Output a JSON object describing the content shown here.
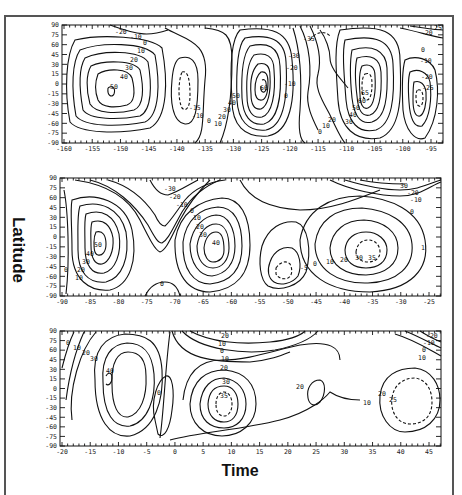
{
  "figure": {
    "ylabel": "Latitude",
    "xlabel": "Time"
  },
  "chart_data": [
    {
      "type": "contour",
      "title": "",
      "xlabel": "Time",
      "ylabel": "Latitude",
      "xlim": [
        -160,
        -93
      ],
      "ylim": [
        -90,
        90
      ],
      "x_ticks": [
        "-160",
        "-155",
        "-150",
        "-145",
        "-140",
        "-135",
        "-130",
        "-125",
        "-120",
        "-115",
        "-110",
        "-105",
        "-100",
        "-95"
      ],
      "y_ticks": [
        "90",
        "75",
        "60",
        "45",
        "30",
        "15",
        "0",
        "-15",
        "-30",
        "-45",
        "-60",
        "-75",
        "-90"
      ],
      "contour_levels": [
        "-35",
        "-30",
        "-25",
        "-20",
        "-15",
        "-10",
        "0",
        "10",
        "20",
        "30",
        "40",
        "50",
        "60",
        "65"
      ],
      "extrema": [
        {
          "x": -151,
          "y": -10,
          "value": 50,
          "type": "max"
        },
        {
          "x": -137,
          "y": -20,
          "value": -15,
          "type": "min"
        },
        {
          "x": -127,
          "y": 0,
          "value": 60,
          "type": "max"
        },
        {
          "x": -118,
          "y": 75,
          "value": -35,
          "type": "min"
        },
        {
          "x": -106,
          "y": -10,
          "value": 65,
          "type": "max"
        },
        {
          "x": -96,
          "y": -10,
          "value": -25,
          "type": "min"
        }
      ],
      "labels": [
        "-20",
        "-10",
        "0",
        "10",
        "20",
        "30",
        "40",
        "50",
        "-15",
        "-10",
        "0",
        "10",
        "20",
        "30",
        "40",
        "50",
        "60",
        "-35",
        "-30",
        "-20",
        "-10",
        "0",
        "0",
        "10",
        "20",
        "30",
        "40",
        "50",
        "60",
        "65",
        "-25",
        "-20",
        "-10",
        "0",
        "-20"
      ]
    },
    {
      "type": "contour",
      "xlabel": "Time",
      "ylabel": "Latitude",
      "xlim": [
        -90,
        -22
      ],
      "ylim": [
        -90,
        90
      ],
      "x_ticks": [
        "-90",
        "-85",
        "-80",
        "-75",
        "-70",
        "-65",
        "-60",
        "-55",
        "-50",
        "-45",
        "-40",
        "-35",
        "-30",
        "-25"
      ],
      "y_ticks": [
        "90",
        "75",
        "60",
        "45",
        "30",
        "15",
        "0",
        "-15",
        "-30",
        "-45",
        "-60",
        "-75",
        "-90"
      ],
      "contour_levels": [
        "-30",
        "-20",
        "-10",
        "-5",
        "0",
        "10",
        "20",
        "30",
        "35",
        "40",
        "50"
      ],
      "extrema": [
        {
          "x": -82,
          "y": 0,
          "value": 50,
          "type": "max"
        },
        {
          "x": -60,
          "y": -5,
          "value": 40,
          "type": "max"
        },
        {
          "x": -47,
          "y": -45,
          "value": -5,
          "type": "min"
        },
        {
          "x": -32,
          "y": -25,
          "value": 35,
          "type": "max"
        },
        {
          "x": -30,
          "y": 80,
          "value": -30,
          "type": "min"
        },
        {
          "x": -68,
          "y": 80,
          "value": -30,
          "type": "min"
        }
      ],
      "labels": [
        "-30",
        "-20",
        "-10",
        "0",
        "10",
        "20",
        "30",
        "40",
        "50",
        "40",
        "30",
        "20",
        "10",
        "0",
        "0",
        "-5",
        "0",
        "10",
        "20",
        "30",
        "35",
        "30",
        "-20",
        "-10",
        "0",
        "1"
      ]
    },
    {
      "type": "contour",
      "xlabel": "Time",
      "ylabel": "Latitude",
      "xlim": [
        -20,
        48
      ],
      "ylim": [
        -90,
        90
      ],
      "x_ticks": [
        "-20",
        "-15",
        "-10",
        "-5",
        "0",
        "5",
        "10",
        "15",
        "20",
        "25",
        "30",
        "35",
        "40",
        "45"
      ],
      "y_ticks": [
        "90",
        "75",
        "60",
        "45",
        "30",
        "15",
        "0",
        "-15",
        "-30",
        "-45",
        "-60",
        "-75",
        "-90"
      ],
      "contour_levels": [
        "-20",
        "-10",
        "0",
        "10",
        "20",
        "25",
        "30",
        "35",
        "40"
      ],
      "extrema": [
        {
          "x": -11,
          "y": 20,
          "value": 40,
          "type": "max"
        },
        {
          "x": -2,
          "y": -5,
          "value": 0,
          "type": "min"
        },
        {
          "x": 9,
          "y": -15,
          "value": 35,
          "type": "max"
        },
        {
          "x": 24,
          "y": 10,
          "value": 20,
          "type": "max"
        },
        {
          "x": 41,
          "y": -10,
          "value": 25,
          "type": "max"
        },
        {
          "x": 12,
          "y": 85,
          "value": -20,
          "type": "min"
        }
      ],
      "labels": [
        "0",
        "10",
        "20",
        "30",
        "40",
        "0",
        "20",
        "10",
        "0",
        "10",
        "20",
        "30",
        "35",
        "20",
        "10",
        "20",
        "25",
        "-20",
        "-10",
        "0",
        "10"
      ]
    }
  ]
}
